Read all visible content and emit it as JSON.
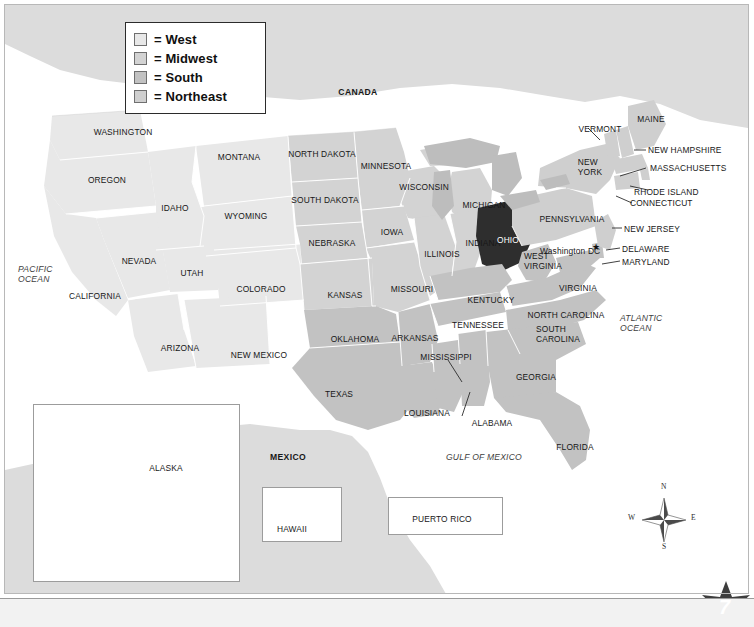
{
  "page": {
    "number": "7",
    "background_color": "#ffffff",
    "frame_color": "#b8b8b8"
  },
  "legend": {
    "name": "region-legend",
    "items": [
      {
        "label": "= West",
        "region": "West",
        "color": "#e8e8e8"
      },
      {
        "label": "= Midwest",
        "region": "Midwest",
        "color": "#d3d3d3"
      },
      {
        "label": "= South",
        "region": "South",
        "color": "#c2c2c2"
      },
      {
        "label": "= Northeast",
        "region": "Northeast",
        "color": "#cfcfcf"
      }
    ]
  },
  "colors": {
    "west": "#e8e8e8",
    "midwest": "#d3d3d3",
    "south": "#c2c2c2",
    "northeast": "#cfcfcf",
    "highlight_ohio": "#2e2e2e",
    "neighbor_country": "#dcdcdc",
    "great_lakes": "#bdbdbd",
    "border_line": "#ffffff",
    "label_text": "#171717"
  },
  "highlight": {
    "state": "OHIO",
    "label": "OHIO",
    "fill": "#2e2e2e",
    "text_color": "#ffffff"
  },
  "labels": {
    "countries": [
      "CANADA",
      "MEXICO"
    ],
    "oceans": [
      "PACIFIC OCEAN",
      "ATLANTIC OCEAN",
      "GULF OF MEXICO"
    ],
    "capital": "Washington DC",
    "insets": [
      "ALASKA",
      "HAWAII",
      "PUERTO RICO"
    ]
  },
  "states": {
    "west": [
      "WASHINGTON",
      "OREGON",
      "IDAHO",
      "MONTANA",
      "WYOMING",
      "NEVADA",
      "UTAH",
      "COLORADO",
      "CALIFORNIA",
      "ARIZONA",
      "NEW MEXICO",
      "ALASKA",
      "HAWAII"
    ],
    "midwest": [
      "NORTH DAKOTA",
      "SOUTH DAKOTA",
      "MINNESOTA",
      "WISCONSIN",
      "MICHIGAN",
      "IOWA",
      "NEBRASKA",
      "KANSAS",
      "MISSOURI",
      "ILLINOIS",
      "INDIANA",
      "OHIO"
    ],
    "south": [
      "OKLAHOMA",
      "TEXAS",
      "ARKANSAS",
      "LOUISIANA",
      "MISSISSIPPI",
      "ALABAMA",
      "TENNESSEE",
      "KENTUCKY",
      "WEST VIRGINIA",
      "VIRGINIA",
      "NORTH CAROLINA",
      "SOUTH CAROLINA",
      "GEORGIA",
      "FLORIDA",
      "DELAWARE",
      "MARYLAND"
    ],
    "northeast": [
      "MAINE",
      "NEW HAMPSHIRE",
      "VERMONT",
      "MASSACHUSETTS",
      "RHODE ISLAND",
      "CONNECTICUT",
      "NEW YORK",
      "NEW JERSEY",
      "PENNSYLVANIA"
    ]
  },
  "map_labels": [
    {
      "id": "canada",
      "text": "CANADA",
      "x": 358,
      "y": 91,
      "style": "b"
    },
    {
      "id": "mexico",
      "text": "MEXICO",
      "x": 288,
      "y": 456,
      "style": "b"
    },
    {
      "id": "washington",
      "text": "WASHINGTON",
      "x": 93,
      "y": 127,
      "style": ""
    },
    {
      "id": "oregon",
      "text": "OREGON",
      "x": 88,
      "y": 175,
      "style": ""
    },
    {
      "id": "idaho",
      "text": "IDAHO",
      "x": 162,
      "y": 203,
      "style": ""
    },
    {
      "id": "montana",
      "text": "MONTANA",
      "x": 212,
      "y": 152,
      "style": ""
    },
    {
      "id": "wyoming",
      "text": "WYOMING",
      "x": 222,
      "y": 211,
      "style": ""
    },
    {
      "id": "nevada",
      "text": "NEVADA",
      "x": 122,
      "y": 256,
      "style": ""
    },
    {
      "id": "utah",
      "text": "UTAH",
      "x": 180,
      "y": 268,
      "style": ""
    },
    {
      "id": "colorado",
      "text": "COLORADO",
      "x": 238,
      "y": 284,
      "style": ""
    },
    {
      "id": "california",
      "text": "CALIFORNIA",
      "x": 68,
      "y": 291,
      "style": ""
    },
    {
      "id": "arizona",
      "text": "ARIZONA",
      "x": 163,
      "y": 343,
      "style": ""
    },
    {
      "id": "new-mexico",
      "text": "NEW MEXICO",
      "x": 227,
      "y": 350,
      "style": ""
    },
    {
      "id": "north-dakota",
      "text": "NORTH DAKOTA",
      "x": 290,
      "y": 149,
      "style": ""
    },
    {
      "id": "south-dakota",
      "text": "SOUTH DAKOTA",
      "x": 292,
      "y": 195,
      "style": ""
    },
    {
      "id": "nebraska",
      "text": "NEBRASKA",
      "x": 305,
      "y": 238,
      "style": ""
    },
    {
      "id": "kansas",
      "text": "KANSAS",
      "x": 326,
      "y": 290,
      "style": ""
    },
    {
      "id": "minnesota",
      "text": "MINNESOTA",
      "x": 360,
      "y": 164,
      "style": ""
    },
    {
      "id": "iowa",
      "text": "IOWA",
      "x": 381,
      "y": 227,
      "style": ""
    },
    {
      "id": "missouri",
      "text": "MISSOURI",
      "x": 392,
      "y": 284,
      "style": ""
    },
    {
      "id": "wisconsin",
      "text": "WISCONSIN",
      "x": 401,
      "y": 182,
      "style": ""
    },
    {
      "id": "illinois",
      "text": "ILLINOIS",
      "x": 427,
      "y": 249,
      "style": ""
    },
    {
      "id": "michigan",
      "text": "MICHIGAN",
      "x": 466,
      "y": 200,
      "style": ""
    },
    {
      "id": "indiana",
      "text": "INDIANA",
      "x": 467,
      "y": 240,
      "style": ""
    },
    {
      "id": "ohio",
      "text": "OHIO",
      "x": 501,
      "y": 237,
      "style": "white"
    },
    {
      "id": "kentucky",
      "text": "KENTUCKY",
      "x": 474,
      "y": 295,
      "style": ""
    },
    {
      "id": "tennessee",
      "text": "TENNESSEE",
      "x": 458,
      "y": 320,
      "style": ""
    },
    {
      "id": "oklahoma",
      "text": "OKLAHOMA",
      "x": 332,
      "y": 334,
      "style": ""
    },
    {
      "id": "arkansas",
      "text": "ARKANSAS",
      "x": 394,
      "y": 333,
      "style": ""
    },
    {
      "id": "texas",
      "text": "TEXAS",
      "x": 323,
      "y": 389,
      "style": ""
    },
    {
      "id": "louisiana",
      "text": "LOUISIANA",
      "x": 406,
      "y": 408,
      "style": ""
    },
    {
      "id": "mississippi",
      "text": "MISSISSIPPI",
      "x": 422,
      "y": 355,
      "style": ""
    },
    {
      "id": "alabama",
      "text": "ALABAMA",
      "x": 470,
      "y": 420,
      "style": ""
    },
    {
      "id": "georgia",
      "text": "GEORGIA",
      "x": 518,
      "y": 372,
      "style": ""
    },
    {
      "id": "florida",
      "text": "FLORIDA",
      "x": 556,
      "y": 442,
      "style": ""
    },
    {
      "id": "north-carolina",
      "text": "NORTH CAROLINA",
      "x": 534,
      "y": 312,
      "style": ""
    },
    {
      "id": "virginia",
      "text": "VIRGINIA",
      "x": 558,
      "y": 283,
      "style": ""
    },
    {
      "id": "pennsylvania",
      "text": "PENNSYLVANIA",
      "x": 542,
      "y": 216,
      "style": ""
    },
    {
      "id": "vermont",
      "text": "VERMONT",
      "x": 577,
      "y": 124,
      "style": ""
    },
    {
      "id": "maine",
      "text": "MAINE",
      "x": 634,
      "y": 116,
      "style": ""
    },
    {
      "id": "new-hampshire",
      "text": "NEW HAMPSHIRE",
      "x": 648,
      "y": 148,
      "style": ""
    },
    {
      "id": "massachusetts",
      "text": "MASSACHUSETTS",
      "x": 650,
      "y": 166,
      "style": ""
    },
    {
      "id": "rhode-island",
      "text": "RHODE ISLAND",
      "x": 640,
      "y": 192,
      "style": ""
    },
    {
      "id": "connecticut",
      "text": "CONNECTICUT",
      "x": 634,
      "y": 203,
      "style": ""
    },
    {
      "id": "new-jersey",
      "text": "NEW JERSEY",
      "x": 624,
      "y": 228,
      "style": ""
    },
    {
      "id": "delaware",
      "text": "DELAWARE",
      "x": 622,
      "y": 248,
      "style": ""
    },
    {
      "id": "maryland",
      "text": "MARYLAND",
      "x": 622,
      "y": 261,
      "style": ""
    },
    {
      "id": "washington-dc",
      "text": "Washington DC",
      "x": 540,
      "y": 250,
      "style": ""
    }
  ],
  "two_line_labels": [
    {
      "id": "new-york",
      "line1": "NEW",
      "line2": "YORK",
      "x": 588,
      "y": 163
    },
    {
      "id": "west-virginia",
      "line1": "WEST",
      "line2": "VIRGINIA",
      "x": 527,
      "y": 257
    },
    {
      "id": "south-carolina",
      "line1": "SOUTH",
      "line2": "CAROLINA",
      "x": 540,
      "y": 329
    },
    {
      "id": "pacific-ocean",
      "line1": "PACIFIC",
      "line2": "OCEAN",
      "x": 18,
      "y": 268
    },
    {
      "id": "atlantic-ocean",
      "line1": "ATLANTIC",
      "line2": "OCEAN",
      "x": 620,
      "y": 317
    }
  ],
  "gulf_label": {
    "text": "GULF OF MEXICO",
    "x": 444,
    "y": 452
  },
  "insets": {
    "alaska": {
      "label": "ALASKA",
      "label_x": 150,
      "label_y": 463
    },
    "hawaii": {
      "label": "HAWAII",
      "label_x": 275,
      "label_y": 524
    },
    "puerto_rico": {
      "label": "PUERTO RICO",
      "label_x": 414,
      "label_y": 514
    }
  },
  "compass": {
    "north": "N",
    "east": "E",
    "south": "S",
    "west": "W"
  }
}
